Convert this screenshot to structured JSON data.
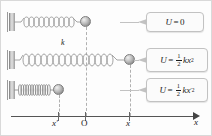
{
  "figure": {
    "background_color": "#fdfdfd",
    "border_color": "#d9d9d9"
  },
  "rows": [
    {
      "id": "relaxed",
      "state_label": "relaxed",
      "spring_coils": 11,
      "ball_position_label": "O",
      "callout": {
        "U": "U",
        "equals": "=",
        "value": "0",
        "full_text": "U = 0"
      }
    },
    {
      "id": "stretched",
      "state_label": "stretched",
      "spring_coils": 15,
      "spring_constant_label": "k",
      "ball_position_label": "x",
      "callout": {
        "U": "U",
        "equals": "=",
        "numerator": "1",
        "denominator": "2",
        "term": "kx",
        "exponent": "2",
        "full_text": "U = 1/2 kx²"
      }
    },
    {
      "id": "compressed",
      "state_label": "compressed",
      "spring_coils": 14,
      "ball_position_label": "x′",
      "callout": {
        "U": "U",
        "equals": "=",
        "numerator": "1",
        "denominator": "2",
        "term": "kx",
        "prime": "′",
        "exponent": "2",
        "full_text": "U = 1/2 kx′²"
      }
    }
  ],
  "axis": {
    "label": "x",
    "ticks": [
      {
        "id": "x-prime",
        "label": "x",
        "prime": "′",
        "x_px": 53
      },
      {
        "id": "origin",
        "label": "O",
        "prime": "",
        "x_px": 85
      },
      {
        "id": "x",
        "label": "x",
        "prime": "",
        "x_px": 129
      }
    ]
  },
  "colors": {
    "ball": "#8f8f8f",
    "spring": "#9a9a9a",
    "wall": "#b8b8b8",
    "axis": "#555555",
    "dashed_line": "#b0b0b0",
    "callout_border": "#c2c2c2",
    "callout_fill": "#fbfbfb",
    "text": "#1b1b1b"
  }
}
